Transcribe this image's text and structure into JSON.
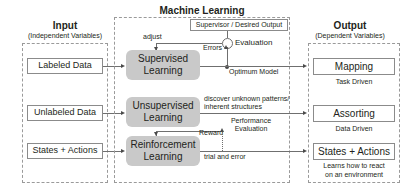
{
  "diagram": {
    "columns": {
      "input": {
        "heading": "Input",
        "subheading": "(Independent Variables)",
        "items": [
          {
            "label": "Labeled Data"
          },
          {
            "label": "Unlabeled Data"
          },
          {
            "label": "States + Actions"
          }
        ]
      },
      "middle": {
        "heading": "Machine Learning",
        "processes": [
          {
            "line1": "Supervised",
            "line2": "Learning"
          },
          {
            "line1": "Unsupervised",
            "line2": "Learning"
          },
          {
            "line1": "Reinforcement",
            "line2": "Learning"
          }
        ],
        "supervisor_box": "Supervisor / Desired Output",
        "evaluation_label": "Evaluation",
        "edge_labels": {
          "adjust": "adjust",
          "errors": "Errors",
          "optimum_model": "Optimum Model",
          "discover_line1": "discover unknown patterns/",
          "discover_line2": "inherent structures",
          "reward": "Reward",
          "performance_line1": "Performance",
          "performance_line2": "Evaluation",
          "trial_and_error": "trial and error"
        }
      },
      "output": {
        "heading": "Output",
        "subheading": "(Dependent Variables)",
        "items": [
          {
            "label": "Mapping",
            "caption": "Task Driven"
          },
          {
            "label": "Assorting",
            "caption": "Data Driven"
          },
          {
            "label": "States + Actions",
            "caption_line1": "Learns how to react",
            "caption_line2": "on an environment"
          }
        ]
      }
    },
    "colors": {
      "process_fill": "#c9c9c9",
      "dashed_border": "#9a9a9a",
      "solid_border": "#8b8b8b",
      "line": "#6f6f6f",
      "text": "#231f20"
    }
  }
}
